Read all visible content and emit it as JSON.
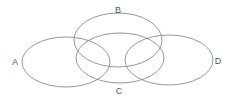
{
  "diagram": {
    "type": "venn",
    "stroke_color": "#8a8a8a",
    "label_color": "#555555",
    "sets": [
      {
        "id": "A",
        "label": "A",
        "cx": 66,
        "cy": 62,
        "rx": 44,
        "ry": 25,
        "label_x": 15,
        "label_y": 65
      },
      {
        "id": "B",
        "label": "B",
        "cx": 118,
        "cy": 40,
        "rx": 44,
        "ry": 27,
        "label_x": 118,
        "label_y": 13
      },
      {
        "id": "C",
        "label": "C",
        "cx": 120,
        "cy": 58,
        "rx": 44,
        "ry": 25,
        "label_x": 119,
        "label_y": 94
      },
      {
        "id": "D",
        "label": "D",
        "cx": 169,
        "cy": 60,
        "rx": 44,
        "ry": 25,
        "label_x": 218,
        "label_y": 64
      }
    ]
  }
}
